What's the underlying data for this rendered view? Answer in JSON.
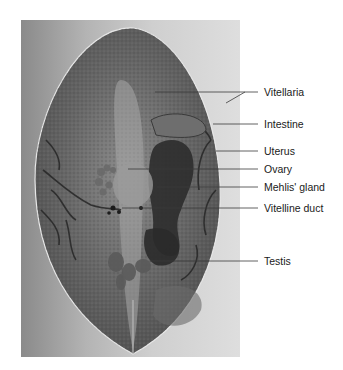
{
  "figure": {
    "labels": [
      {
        "id": "vitellaria",
        "text": "Vitellaria",
        "y": 92
      },
      {
        "id": "intestine",
        "text": "Intestine",
        "y": 124
      },
      {
        "id": "uterus",
        "text": "Uterus",
        "y": 151
      },
      {
        "id": "ovary",
        "text": "Ovary",
        "y": 169
      },
      {
        "id": "mehlis-gland",
        "text": "Mehlis' gland",
        "y": 187
      },
      {
        "id": "vitelline-duct",
        "text": "Vitelline duct",
        "y": 208
      },
      {
        "id": "testis",
        "text": "Testis",
        "y": 261
      }
    ]
  },
  "colors": {
    "background": "#ffffff",
    "photo_bg_dark": "#8a8a8a",
    "photo_bg_light": "#dedede",
    "specimen": "#5e5e5e",
    "organ_dark": "#2a2a2a",
    "leader_line": "#3a3a3a",
    "label_text": "#1a1a1a"
  }
}
